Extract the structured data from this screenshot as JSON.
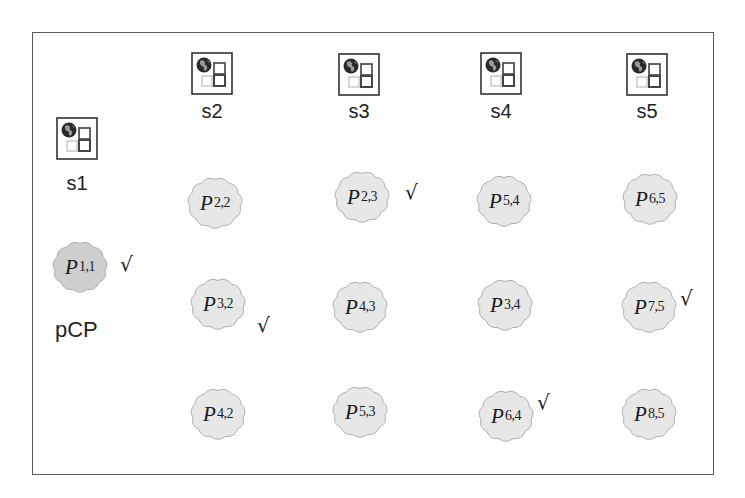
{
  "diagram": {
    "frame": {
      "x": 32,
      "y": 32,
      "width": 682,
      "height": 443,
      "border_color": "#5a5a5a"
    },
    "colors": {
      "blob_fill": "#e7e7e7",
      "blob_fill_highlight": "#cfcfcf",
      "blob_stroke": "#a8a8a8",
      "text": "#1a1a1a"
    },
    "servers": [
      {
        "id": "s1",
        "label": "s1",
        "icon": "server-globe-icon",
        "x": 56,
        "y": 117,
        "label_y": 172
      },
      {
        "id": "s2",
        "label": "s2",
        "icon": "server-globe-icon",
        "x": 191,
        "y": 52,
        "label_y": 100
      },
      {
        "id": "s3",
        "label": "s3",
        "icon": "server-globe-icon",
        "x": 338,
        "y": 53,
        "label_y": 100
      },
      {
        "id": "s4",
        "label": "s4",
        "icon": "server-globe-icon",
        "x": 480,
        "y": 52,
        "label_y": 100
      },
      {
        "id": "s5",
        "label": "s5",
        "icon": "server-globe-icon",
        "x": 626,
        "y": 53,
        "label_y": 100
      }
    ],
    "processes": [
      {
        "name": "P",
        "sub": "1,1",
        "server": "s1",
        "cx": 80,
        "cy": 267,
        "checked": true,
        "highlight": true,
        "check_x": 120,
        "check_y": 254
      },
      {
        "name": "P",
        "sub": "2,2",
        "server": "s2",
        "cx": 215,
        "cy": 203,
        "checked": false,
        "highlight": false
      },
      {
        "name": "P",
        "sub": "3,2",
        "server": "s2",
        "cx": 218,
        "cy": 304,
        "checked": true,
        "highlight": false,
        "check_x": 257,
        "check_y": 315
      },
      {
        "name": "P",
        "sub": "4,2",
        "server": "s2",
        "cx": 218,
        "cy": 414,
        "checked": false,
        "highlight": false
      },
      {
        "name": "P",
        "sub": "2,3",
        "server": "s3",
        "cx": 362,
        "cy": 197,
        "checked": true,
        "highlight": false,
        "check_x": 405,
        "check_y": 182
      },
      {
        "name": "P",
        "sub": "4,3",
        "server": "s3",
        "cx": 360,
        "cy": 307,
        "checked": false,
        "highlight": false
      },
      {
        "name": "P",
        "sub": "5,3",
        "server": "s3",
        "cx": 360,
        "cy": 412,
        "checked": false,
        "highlight": false
      },
      {
        "name": "P",
        "sub": "5,4",
        "server": "s4",
        "cx": 504,
        "cy": 201,
        "checked": false,
        "highlight": false
      },
      {
        "name": "P",
        "sub": "3,4",
        "server": "s4",
        "cx": 505,
        "cy": 305,
        "checked": false,
        "highlight": false
      },
      {
        "name": "P",
        "sub": "6,4",
        "server": "s4",
        "cx": 506,
        "cy": 416,
        "checked": true,
        "highlight": false,
        "check_x": 537,
        "check_y": 392
      },
      {
        "name": "P",
        "sub": "6,5",
        "server": "s5",
        "cx": 650,
        "cy": 199,
        "checked": false,
        "highlight": false
      },
      {
        "name": "P",
        "sub": "7,5",
        "server": "s5",
        "cx": 649,
        "cy": 307,
        "checked": true,
        "highlight": false,
        "check_x": 680,
        "check_y": 288
      },
      {
        "name": "P",
        "sub": "8,5",
        "server": "s5",
        "cx": 649,
        "cy": 414,
        "checked": false,
        "highlight": false
      }
    ],
    "check_symbol": "√",
    "pcp_label": {
      "text": "pCP",
      "x": 55,
      "y": 317
    }
  }
}
